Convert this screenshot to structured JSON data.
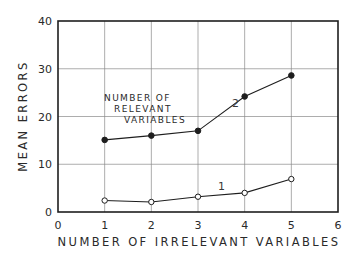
{
  "chart_data": {
    "type": "line",
    "title": "",
    "xlabel": "NUMBER OF IRRELEVANT VARIABLES",
    "ylabel": "MEAN ERRORS",
    "xlim": [
      0,
      6
    ],
    "ylim": [
      0,
      40
    ],
    "x_ticks": [
      "0",
      "1",
      "2",
      "3",
      "4",
      "5",
      "6"
    ],
    "y_ticks": [
      "0",
      "10",
      "20",
      "30",
      "40"
    ],
    "grid": true,
    "annotation": [
      "NUMBER OF",
      "RELEVANT",
      "VARIABLES"
    ],
    "x": [
      1,
      2,
      3,
      4,
      5
    ],
    "series": [
      {
        "name": "1",
        "marker": "open-circle",
        "values": [
          2.4,
          2.1,
          3.2,
          4.0,
          6.9
        ]
      },
      {
        "name": "2",
        "marker": "filled-circle",
        "values": [
          15.1,
          16.0,
          17.0,
          24.2,
          28.6
        ]
      }
    ],
    "colors": {
      "ink": "#1e1e1e",
      "grid": "#8a8a8a",
      "background": "#ffffff"
    }
  }
}
